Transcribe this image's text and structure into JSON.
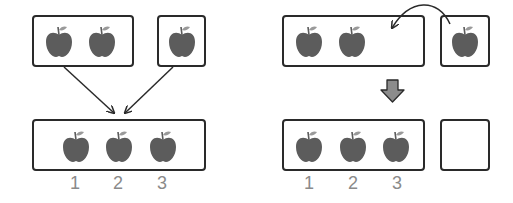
{
  "colors": {
    "apple": "#5c5c5c",
    "leaf": "#9a9a9a",
    "stroke": "#2a2a2a",
    "number": "#8a8a8a",
    "arrow_fill": "#8c8c8c"
  },
  "left_panel": {
    "top_group_a": {
      "apple_count": 2
    },
    "top_group_b": {
      "apple_count": 1
    },
    "combined_group": {
      "apple_count": 3
    },
    "count_labels": [
      "1",
      "2",
      "3"
    ]
  },
  "right_panel": {
    "top_group_a": {
      "apple_count": 2
    },
    "top_group_b": {
      "apple_count": 1
    },
    "result_group": {
      "apple_count": 3
    },
    "empty_group": {
      "apple_count": 0
    },
    "count_labels": [
      "1",
      "2",
      "3"
    ]
  }
}
